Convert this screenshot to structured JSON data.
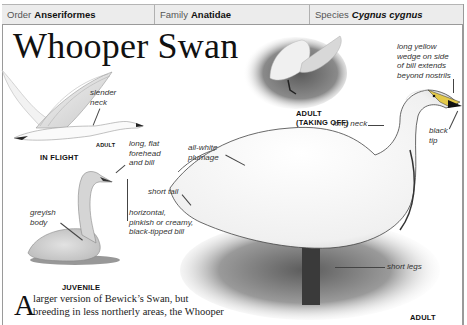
{
  "header": {
    "order_label": "Order",
    "order_value": "Anseriformes",
    "family_label": "Family",
    "family_value": "Anatidae",
    "species_label": "Species",
    "species_value": "Cygnus cygnus"
  },
  "title": "Whooper Swan",
  "illustrations": {
    "in_flight": {
      "caption": "IN FLIGHT",
      "sub_caption": "ADULT",
      "annotations": [
        "slender neck"
      ]
    },
    "juvenile": {
      "caption": "JUVENILE",
      "annotations": [
        "long, flat forehead and bill",
        "greyish body",
        "horizontal, pinkish or creamy, black-tipped bill"
      ]
    },
    "taking_off": {
      "caption_line1": "ADULT",
      "caption_line2": "(TAKING OFF)"
    },
    "adult": {
      "caption": "ADULT",
      "annotations": [
        "long yellow wedge on side of bill extends beyond nostrils",
        "long neck",
        "black tip",
        "all-white plumage",
        "short tail",
        "short legs"
      ]
    }
  },
  "labels": {
    "slender_1": "slender",
    "slender_2": "neck",
    "forehead_1": "long, flat",
    "forehead_2": "forehead",
    "forehead_3": "and bill",
    "greyish_1": "greyish",
    "greyish_2": "body",
    "horiz_1": "horizontal,",
    "horiz_2": "pinkish or creamy,",
    "horiz_3": "black-tipped bill",
    "short_tail": "short tail",
    "white_1": "all-white",
    "white_2": "plumage",
    "wedge_1": "long yellow",
    "wedge_2": "wedge on side",
    "wedge_3": "of bill extends",
    "wedge_4": "beyond nostrils",
    "long_neck": "long neck",
    "black_1": "black",
    "black_2": "tip",
    "short_legs": "short legs"
  },
  "body": {
    "dropcap": "A",
    "line1": "larger version of Bewick’s Swan, but",
    "line2": "breeding in less northerly areas, the Whooper"
  }
}
